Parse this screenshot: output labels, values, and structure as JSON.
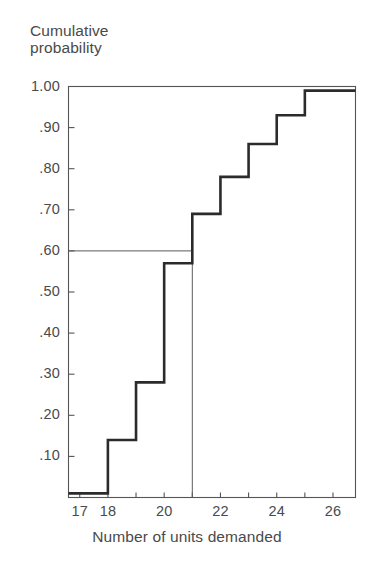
{
  "chart_data": {
    "type": "line",
    "subtype": "step-cumulative-distribution",
    "title": "",
    "ylabel": "Cumulative\nprobability",
    "xlabel": "Number of units demanded",
    "x": [
      17,
      18,
      19,
      20,
      21,
      22,
      23,
      24,
      25,
      26
    ],
    "values": [
      0.01,
      0.01,
      0.14,
      0.28,
      0.57,
      0.69,
      0.78,
      0.86,
      0.93,
      0.99
    ],
    "series": [
      {
        "name": "Cumulative probability",
        "values": [
          0.01,
          0.01,
          0.14,
          0.28,
          0.57,
          0.69,
          0.78,
          0.86,
          0.93,
          0.99
        ]
      }
    ],
    "xlim": [
      16.6,
      26.8
    ],
    "ylim": [
      0,
      1.0
    ],
    "xticks": [
      17,
      18,
      19,
      20,
      21,
      22,
      23,
      24,
      25,
      26
    ],
    "xtick_labels": [
      "17",
      "18",
      "",
      "20",
      "",
      "22",
      "",
      "24",
      "",
      "26"
    ],
    "yticks": [
      0.1,
      0.2,
      0.3,
      0.4,
      0.5,
      0.6,
      0.7,
      0.8,
      0.9,
      1.0
    ],
    "ytick_labels": [
      ".10",
      ".20",
      ".30",
      ".40",
      ".50",
      ".60",
      ".70",
      ".80",
      ".90",
      "1.00"
    ],
    "grid": false,
    "legend": null,
    "annotations": [
      {
        "name": "reference-line-horizontal",
        "description": "Horizontal reference line at cumulative probability .60 extending from y-axis to x = 21",
        "y": 0.6,
        "x_from": 16.6,
        "x_to": 21
      },
      {
        "name": "reference-line-vertical",
        "description": "Vertical reference line at 21 units demanded dropping from .60 to the x-axis",
        "x": 21,
        "y_from": 0.6,
        "y_to": 0
      }
    ],
    "colors": {
      "step_line": "#2b2b2b",
      "axis": "#555555",
      "reference_line": "#5a5a5a",
      "background": "#ffffff",
      "text": "#4a4a4a"
    }
  },
  "axis": {
    "y_title_line1": "Cumulative",
    "y_title_line2": "probability",
    "x_title": "Number of units demanded",
    "y_labels": [
      {
        "text": "1.00",
        "value": 1.0
      },
      {
        "text": ".90",
        "value": 0.9
      },
      {
        "text": ".80",
        "value": 0.8
      },
      {
        "text": ".70",
        "value": 0.7
      },
      {
        "text": ".60",
        "value": 0.6
      },
      {
        "text": ".50",
        "value": 0.5
      },
      {
        "text": ".40",
        "value": 0.4
      },
      {
        "text": ".30",
        "value": 0.3
      },
      {
        "text": ".20",
        "value": 0.2
      },
      {
        "text": ".10",
        "value": 0.1
      }
    ],
    "x_labels": [
      {
        "text": "17",
        "value": 17
      },
      {
        "text": "18",
        "value": 18
      },
      {
        "text": "20",
        "value": 20
      },
      {
        "text": "22",
        "value": 22
      },
      {
        "text": "24",
        "value": 24
      },
      {
        "text": "26",
        "value": 26
      }
    ]
  }
}
